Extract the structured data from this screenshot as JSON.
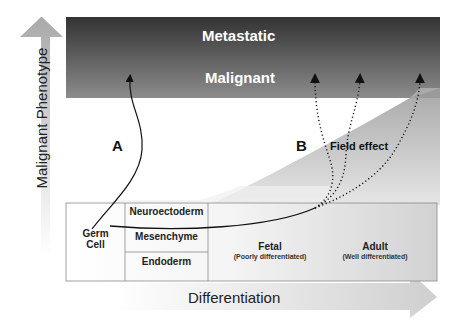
{
  "diagram": {
    "bands": {
      "metastatic": "Metastatic",
      "malignant": "Malignant"
    },
    "pathways": {
      "a": "A",
      "b": "B",
      "field_effect": "Field effect"
    },
    "table": {
      "germ_cell": "Germ\nCell",
      "germ_line1": "Germ",
      "germ_line2": "Cell",
      "layers": [
        "Neuroectoderm",
        "Mesenchyme",
        "Endoderm"
      ],
      "fetal": "Fetal",
      "fetal_sub": "(Poorly differentiated)",
      "adult": "Adult",
      "adult_sub": "(Well differentiated)"
    },
    "axes": {
      "y_label": "Malignant Phenotype",
      "x_label": "Differentiation"
    },
    "colors": {
      "band_top": "#3a3a3a",
      "band_bottom": "#8a8a8a",
      "field_gray": "#b8b8b8",
      "arrow_gray": "#b0b0b0",
      "line": "#111111"
    }
  }
}
